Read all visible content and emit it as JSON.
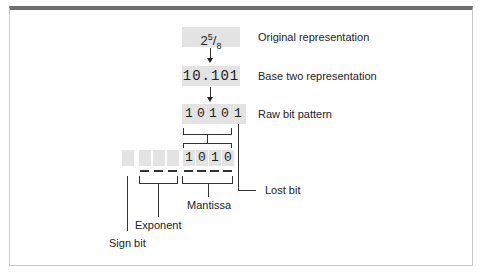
{
  "figure": {
    "original": {
      "whole": "2",
      "num": "5",
      "den": "8",
      "label": "Original representation"
    },
    "base_two": {
      "value": "10.101",
      "label": "Base two representation"
    },
    "raw": {
      "bits": [
        "1",
        "0",
        "1",
        "0",
        "1"
      ],
      "label": "Raw bit pattern"
    },
    "mantissa_bits": [
      "1",
      "0",
      "1",
      "0"
    ],
    "labels": {
      "lost_bit": "Lost bit",
      "mantissa": "Mantissa",
      "exponent": "Exponent",
      "sign_bit": "Sign bit"
    }
  }
}
